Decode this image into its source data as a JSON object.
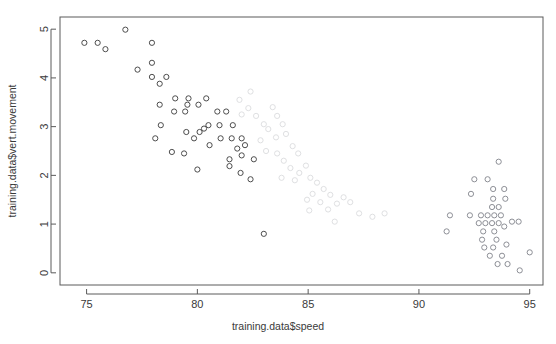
{
  "chart_data": {
    "type": "scatter",
    "title": "",
    "xlabel": "training.data$speed",
    "ylabel": "training.data$vert.movement",
    "xlim": [
      73.8,
      95.6
    ],
    "ylim": [
      -0.25,
      5.25
    ],
    "xticks": [
      75,
      80,
      85,
      90,
      95
    ],
    "yticks": [
      0,
      1,
      2,
      3,
      4,
      5
    ],
    "xtick_labels": [
      "75",
      "80",
      "85",
      "90",
      "95"
    ],
    "ytick_labels": [
      "0",
      "1",
      "2",
      "3",
      "4",
      "5"
    ],
    "grid": false,
    "legend": null,
    "point_symbol": "open-circle",
    "point_radius": 2.6,
    "series": [
      {
        "name": "dark-group",
        "color": "#4d4d4d",
        "points": [
          [
            74.9,
            4.72
          ],
          [
            75.5,
            4.72
          ],
          [
            75.85,
            4.59
          ],
          [
            76.75,
            4.99
          ],
          [
            77.95,
            4.72
          ],
          [
            77.3,
            4.17
          ],
          [
            77.95,
            4.31
          ],
          [
            77.95,
            4.02
          ],
          [
            78.3,
            3.88
          ],
          [
            78.6,
            4.02
          ],
          [
            78.3,
            3.45
          ],
          [
            79.0,
            3.58
          ],
          [
            79.55,
            3.45
          ],
          [
            78.35,
            3.03
          ],
          [
            78.95,
            3.31
          ],
          [
            79.45,
            3.31
          ],
          [
            79.6,
            3.58
          ],
          [
            80.05,
            3.45
          ],
          [
            78.85,
            2.48
          ],
          [
            79.5,
            2.89
          ],
          [
            79.85,
            2.76
          ],
          [
            80.1,
            2.89
          ],
          [
            80.3,
            2.96
          ],
          [
            78.1,
            2.76
          ],
          [
            79.4,
            2.45
          ],
          [
            80.4,
            3.58
          ],
          [
            80.9,
            3.31
          ],
          [
            81.3,
            3.31
          ],
          [
            80.5,
            3.03
          ],
          [
            81.0,
            3.03
          ],
          [
            80.55,
            2.62
          ],
          [
            81.05,
            2.76
          ],
          [
            81.55,
            2.76
          ],
          [
            81.6,
            3.03
          ],
          [
            82.0,
            2.76
          ],
          [
            82.15,
            2.62
          ],
          [
            81.45,
            2.33
          ],
          [
            81.45,
            2.19
          ],
          [
            81.8,
            2.55
          ],
          [
            82.0,
            2.41
          ],
          [
            81.95,
            2.05
          ],
          [
            82.4,
            1.92
          ],
          [
            80.0,
            2.12
          ],
          [
            82.55,
            2.33
          ],
          [
            83.0,
            0.8
          ]
        ]
      },
      {
        "name": "faded-group",
        "color": "#dfe0e2",
        "points": [
          [
            82.4,
            3.72
          ],
          [
            81.9,
            3.55
          ],
          [
            82.3,
            3.38
          ],
          [
            82.65,
            3.22
          ],
          [
            83.0,
            3.05
          ],
          [
            82.0,
            3.25
          ],
          [
            83.4,
            3.4
          ],
          [
            83.6,
            3.22
          ],
          [
            83.2,
            2.95
          ],
          [
            83.55,
            2.78
          ],
          [
            82.85,
            2.72
          ],
          [
            83.85,
            3.05
          ],
          [
            84.0,
            2.85
          ],
          [
            83.1,
            2.5
          ],
          [
            83.6,
            2.45
          ],
          [
            84.3,
            2.6
          ],
          [
            84.55,
            2.45
          ],
          [
            83.9,
            2.3
          ],
          [
            84.2,
            2.15
          ],
          [
            84.6,
            2.05
          ],
          [
            84.9,
            2.2
          ],
          [
            85.1,
            1.95
          ],
          [
            84.4,
            1.9
          ],
          [
            83.8,
            1.95
          ],
          [
            85.4,
            1.85
          ],
          [
            85.7,
            1.72
          ],
          [
            85.2,
            1.62
          ],
          [
            84.95,
            1.5
          ],
          [
            85.55,
            1.45
          ],
          [
            86.0,
            1.6
          ],
          [
            86.3,
            1.42
          ],
          [
            85.9,
            1.3
          ],
          [
            86.6,
            1.55
          ],
          [
            86.9,
            1.45
          ],
          [
            87.3,
            1.22
          ],
          [
            87.9,
            1.15
          ],
          [
            88.45,
            1.22
          ],
          [
            86.2,
            1.05
          ],
          [
            85.05,
            1.28
          ]
        ]
      },
      {
        "name": "right-cluster",
        "color": "#8d8f96",
        "points": [
          [
            93.6,
            2.28
          ],
          [
            92.5,
            1.92
          ],
          [
            93.1,
            1.92
          ],
          [
            92.35,
            1.62
          ],
          [
            93.35,
            1.72
          ],
          [
            93.85,
            1.72
          ],
          [
            93.35,
            1.52
          ],
          [
            93.9,
            1.52
          ],
          [
            93.3,
            1.35
          ],
          [
            93.6,
            1.35
          ],
          [
            91.4,
            1.18
          ],
          [
            92.3,
            1.18
          ],
          [
            92.8,
            1.18
          ],
          [
            93.1,
            1.18
          ],
          [
            93.4,
            1.18
          ],
          [
            93.7,
            1.18
          ],
          [
            92.7,
            1.02
          ],
          [
            93.0,
            1.02
          ],
          [
            93.3,
            1.02
          ],
          [
            93.6,
            1.02
          ],
          [
            94.2,
            1.05
          ],
          [
            94.5,
            1.05
          ],
          [
            91.25,
            0.85
          ],
          [
            92.9,
            0.85
          ],
          [
            93.4,
            0.85
          ],
          [
            92.85,
            0.68
          ],
          [
            93.5,
            0.68
          ],
          [
            92.95,
            0.52
          ],
          [
            93.35,
            0.52
          ],
          [
            93.95,
            0.58
          ],
          [
            93.2,
            0.35
          ],
          [
            93.75,
            0.35
          ],
          [
            95.0,
            0.42
          ],
          [
            93.55,
            0.18
          ],
          [
            94.0,
            0.18
          ],
          [
            94.55,
            0.05
          ],
          [
            93.85,
            0.95
          ]
        ]
      }
    ]
  },
  "axes": {
    "x_axis_name": "x-axis",
    "y_axis_name": "y-axis"
  }
}
